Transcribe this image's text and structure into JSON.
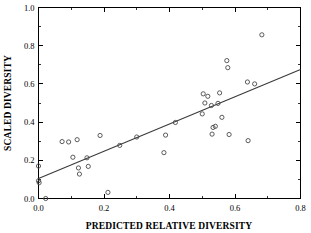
{
  "chart_data": {
    "type": "scatter",
    "title": "",
    "xlabel": "PREDICTED RELATIVE DIVERSITY",
    "ylabel": "SCALED DIVERSITY",
    "xlim": [
      0.0,
      0.8
    ],
    "ylim": [
      0.0,
      1.0
    ],
    "xticks": [
      0.0,
      0.2,
      0.4,
      0.6,
      0.8
    ],
    "xtick_labels": [
      "0.0",
      "0.2",
      "0.4",
      "0.6",
      "0.8"
    ],
    "yticks": [
      0.0,
      0.2,
      0.4,
      0.6,
      0.8,
      1.0
    ],
    "ytick_labels": [
      "0.0",
      "0.2",
      "0.4",
      "0.6",
      "0.8",
      "1.0"
    ],
    "x_minor_ticks": [
      0.1,
      0.3,
      0.5,
      0.7
    ],
    "y_minor_ticks": [
      0.1,
      0.3,
      0.5,
      0.7,
      0.9
    ],
    "grid": false,
    "legend": null,
    "marker": "open-circle",
    "marker_color": "#4a4a4a",
    "points": [
      {
        "x": 0.0,
        "y": 0.17
      },
      {
        "x": 0.0,
        "y": 0.093
      },
      {
        "x": 0.002,
        "y": 0.083
      },
      {
        "x": 0.022,
        "y": 0.0
      },
      {
        "x": 0.072,
        "y": 0.298
      },
      {
        "x": 0.092,
        "y": 0.296
      },
      {
        "x": 0.105,
        "y": 0.216
      },
      {
        "x": 0.118,
        "y": 0.308
      },
      {
        "x": 0.122,
        "y": 0.16
      },
      {
        "x": 0.125,
        "y": 0.128
      },
      {
        "x": 0.148,
        "y": 0.213
      },
      {
        "x": 0.152,
        "y": 0.168
      },
      {
        "x": 0.188,
        "y": 0.33
      },
      {
        "x": 0.212,
        "y": 0.032
      },
      {
        "x": 0.248,
        "y": 0.278
      },
      {
        "x": 0.3,
        "y": 0.322
      },
      {
        "x": 0.383,
        "y": 0.24
      },
      {
        "x": 0.388,
        "y": 0.332
      },
      {
        "x": 0.418,
        "y": 0.398
      },
      {
        "x": 0.5,
        "y": 0.443
      },
      {
        "x": 0.503,
        "y": 0.548
      },
      {
        "x": 0.508,
        "y": 0.5
      },
      {
        "x": 0.517,
        "y": 0.535
      },
      {
        "x": 0.528,
        "y": 0.487
      },
      {
        "x": 0.53,
        "y": 0.337
      },
      {
        "x": 0.533,
        "y": 0.372
      },
      {
        "x": 0.54,
        "y": 0.378
      },
      {
        "x": 0.548,
        "y": 0.498
      },
      {
        "x": 0.553,
        "y": 0.553
      },
      {
        "x": 0.56,
        "y": 0.425
      },
      {
        "x": 0.575,
        "y": 0.722
      },
      {
        "x": 0.578,
        "y": 0.685
      },
      {
        "x": 0.582,
        "y": 0.335
      },
      {
        "x": 0.638,
        "y": 0.61
      },
      {
        "x": 0.64,
        "y": 0.303
      },
      {
        "x": 0.66,
        "y": 0.6
      },
      {
        "x": 0.682,
        "y": 0.857
      }
    ],
    "fit_line": {
      "x_start": 0.0,
      "y_start": 0.105,
      "x_end": 0.8,
      "y_end": 0.675
    }
  }
}
